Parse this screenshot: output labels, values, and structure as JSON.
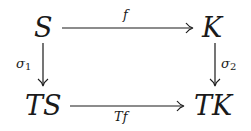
{
  "diagram": {
    "type": "commutative-square",
    "nodes": {
      "top_left": "S",
      "top_right": "K",
      "bottom_left": "TS",
      "bottom_right": "TK"
    },
    "arrows": {
      "top": {
        "from": "S",
        "to": "K",
        "label": "f"
      },
      "bottom": {
        "from": "TS",
        "to": "TK",
        "label": "Tf"
      },
      "left": {
        "from": "S",
        "to": "TS",
        "label": "σ",
        "label_sub": "1"
      },
      "right": {
        "from": "K",
        "to": "TK",
        "label": "σ",
        "label_sub": "2"
      }
    },
    "colors": {
      "ink": "#1a1a1a",
      "background": "#ffffff"
    }
  }
}
